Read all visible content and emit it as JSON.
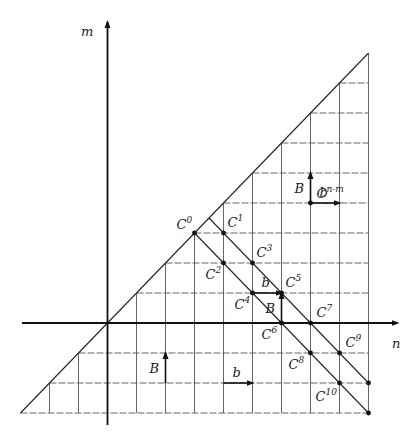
{
  "diagram": {
    "axes": {
      "x_label": "n",
      "y_label": "m",
      "n_range": [
        -3,
        9
      ],
      "m_range": [
        -3,
        9
      ]
    },
    "grid": {
      "region": "between diagonal m=n and bottom row m=-3, right edge n=9",
      "n_min": -3,
      "n_max": 9,
      "m_min": -3
    },
    "points": [
      {
        "id": "C0",
        "base": "C",
        "sup": "0",
        "n": 3,
        "m": 3
      },
      {
        "id": "C1",
        "base": "C",
        "sup": "1",
        "n": 4,
        "m": 3
      },
      {
        "id": "C2",
        "base": "C",
        "sup": "2",
        "n": 4,
        "m": 2
      },
      {
        "id": "C3",
        "base": "C",
        "sup": "3",
        "n": 5,
        "m": 2
      },
      {
        "id": "C4",
        "base": "C",
        "sup": "4",
        "n": 5,
        "m": 1
      },
      {
        "id": "C5",
        "base": "C",
        "sup": "5",
        "n": 6,
        "m": 1
      },
      {
        "id": "C6",
        "base": "C",
        "sup": "6",
        "n": 6,
        "m": 0
      },
      {
        "id": "C7",
        "base": "C",
        "sup": "7",
        "n": 7,
        "m": 0
      },
      {
        "id": "C8",
        "base": "C",
        "sup": "8",
        "n": 7,
        "m": -1
      },
      {
        "id": "C9",
        "base": "C",
        "sup": "9",
        "n": 8,
        "m": -1
      },
      {
        "id": "C10",
        "base": "C",
        "sup": "10",
        "n": 8,
        "m": -2
      },
      {
        "id": "Cnm",
        "base": "C",
        "sup": "n-m",
        "n": 7,
        "m": 4
      },
      {
        "id": "end1",
        "n": 9,
        "m": -2
      },
      {
        "id": "end2",
        "n": 9,
        "m": -3
      }
    ],
    "diagonals": [
      {
        "from": [
          3.5,
          3.5
        ],
        "to": [
          9,
          -2
        ]
      },
      {
        "from": [
          3,
          3
        ],
        "to": [
          9,
          -3
        ]
      }
    ],
    "vectors": [
      {
        "label": "b",
        "dir": "right",
        "n": 5,
        "m": 1
      },
      {
        "label": "B",
        "dir": "up",
        "n": 6,
        "m": 0
      },
      {
        "label": "B",
        "dir": "up",
        "n": 7,
        "m": 4
      },
      {
        "label": "b",
        "dir": "right",
        "n": 7,
        "m": 4
      },
      {
        "label": "B",
        "dir": "up",
        "n": 2,
        "m": -2
      },
      {
        "label": "b",
        "dir": "right",
        "n": 4,
        "m": -2
      }
    ]
  }
}
